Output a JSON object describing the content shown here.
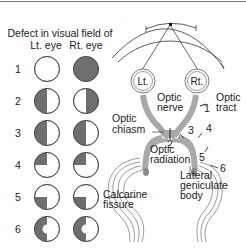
{
  "title": {
    "line1": "Defect in visual field of",
    "left_eye": "Lt. eye",
    "right_eye": "Rt. eye"
  },
  "rows": [
    {
      "n": "1",
      "left": "none",
      "right": "full"
    },
    {
      "n": "2",
      "left": "left-half",
      "right": "right-half"
    },
    {
      "n": "3",
      "left": "left-half",
      "right": "left-half"
    },
    {
      "n": "4",
      "left": "upper-left-quadrant",
      "right": "upper-left-quadrant"
    },
    {
      "n": "5",
      "left": "lower-left-quadrant",
      "right": "lower-left-quadrant"
    },
    {
      "n": "6",
      "left": "left-half-macular-sparing",
      "right": "left-half-macular-sparing"
    }
  ],
  "anatomy": {
    "eye_left": "Lt.",
    "eye_right": "Rt.",
    "optic_nerve": [
      "Optic",
      "nerve"
    ],
    "optic_tract": [
      "Optic",
      "tract"
    ],
    "optic_chiasm": [
      "Optic",
      "chiasm"
    ],
    "optic_radiation": [
      "Optic",
      "radiation"
    ],
    "lgb": [
      "Lateral",
      "geniculate",
      "body"
    ],
    "calcarine": [
      "Calcarine",
      "fissure"
    ],
    "lesions": [
      "1",
      "2",
      "3",
      "4",
      "5",
      "6"
    ]
  },
  "colors": {
    "defect": "#6e6e6e",
    "tract": "#a9a9a9"
  }
}
